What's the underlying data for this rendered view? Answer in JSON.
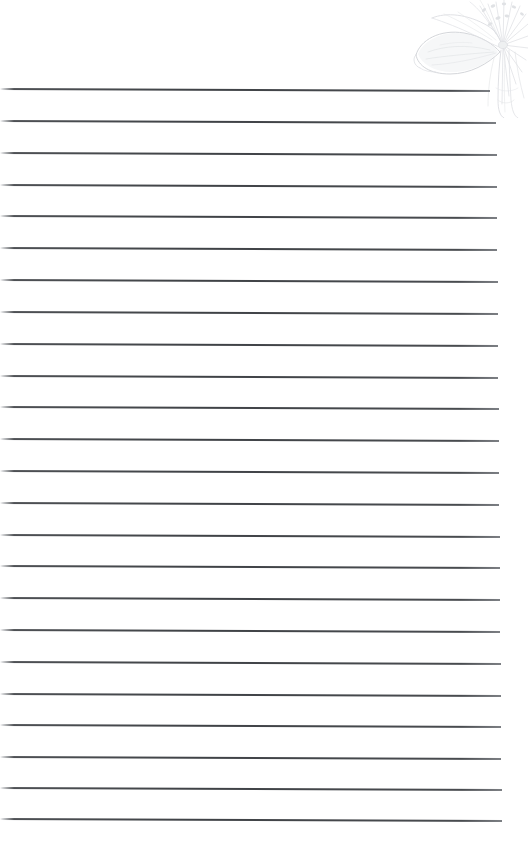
{
  "page": {
    "label": "Lined stationery page",
    "width": 528,
    "height": 866,
    "background_color": "#ffffff",
    "paper_type": "ruled notebook paper",
    "text_content": "",
    "is_blank": "true"
  },
  "rules": {
    "label": "Ruled writing lines",
    "count": 24,
    "first_line_y": 88,
    "spacing": 31.75,
    "line_color": "#3f4246",
    "line_thickness": 1,
    "left_x": 0,
    "right_x_top": 490,
    "right_x_bottom": 502,
    "tilt_degrees": 0.22,
    "lines": [
      {
        "index": 1,
        "y": 88,
        "right_x": 490
      },
      {
        "index": 2,
        "y": 120,
        "right_x": 496
      },
      {
        "index": 3,
        "y": 152,
        "right_x": 497
      },
      {
        "index": 4,
        "y": 184,
        "right_x": 497
      },
      {
        "index": 5,
        "y": 215,
        "right_x": 497
      },
      {
        "index": 6,
        "y": 247,
        "right_x": 497
      },
      {
        "index": 7,
        "y": 279,
        "right_x": 498
      },
      {
        "index": 8,
        "y": 311,
        "right_x": 498
      },
      {
        "index": 9,
        "y": 343,
        "right_x": 498
      },
      {
        "index": 10,
        "y": 375,
        "right_x": 498
      },
      {
        "index": 11,
        "y": 406,
        "right_x": 499
      },
      {
        "index": 12,
        "y": 438,
        "right_x": 499
      },
      {
        "index": 13,
        "y": 470,
        "right_x": 499
      },
      {
        "index": 14,
        "y": 502,
        "right_x": 499
      },
      {
        "index": 15,
        "y": 534,
        "right_x": 500
      },
      {
        "index": 16,
        "y": 565,
        "right_x": 500
      },
      {
        "index": 17,
        "y": 597,
        "right_x": 500
      },
      {
        "index": 18,
        "y": 629,
        "right_x": 500
      },
      {
        "index": 19,
        "y": 661,
        "right_x": 501
      },
      {
        "index": 20,
        "y": 693,
        "right_x": 501
      },
      {
        "index": 21,
        "y": 724,
        "right_x": 501
      },
      {
        "index": 22,
        "y": 756,
        "right_x": 501
      },
      {
        "index": 23,
        "y": 787,
        "right_x": 502
      },
      {
        "index": 24,
        "y": 818,
        "right_x": 502
      }
    ]
  },
  "corner_art": {
    "label": "Faint line-art flower illustration",
    "icon": "flower-line-art-icon",
    "position": "top-right",
    "x": 410,
    "y": 0,
    "width": 118,
    "height": 118,
    "stroke_color": "#d8dade",
    "stroke_color_light": "#e6e8ea",
    "fill_color": "#f4f5f6",
    "opacity": 0.9,
    "elements": [
      "large petal sweeping to the lower-left",
      "radiating stamen burst at upper-right",
      "secondary petal above main petal",
      "stem and bud descending at lower-right",
      "fine vein lines inside petal"
    ]
  },
  "margins": {
    "top_margin_height": 88,
    "bottom_margin_height": 48,
    "right_margin_width": 26
  }
}
